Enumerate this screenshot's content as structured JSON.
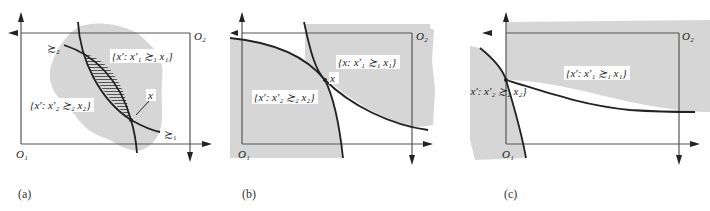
{
  "figure": {
    "panels": [
      {
        "id": "a",
        "caption": "(a)",
        "origin_bottom_left": "O₁",
        "origin_top_right": "O₂",
        "set_label_1": "{x′: x′₁ ≿₁ x₁}",
        "set_label_2": "{x′: x′₂ ≿₂ x₂}",
        "curve_label_1": "≿₁",
        "curve_label_2": "≿₂",
        "point_label": "x"
      },
      {
        "id": "b",
        "caption": "(b)",
        "origin_bottom_left": "O₁",
        "origin_top_right": "O₂",
        "set_label_1": "{x: x′₁ ≿₁ x₁}",
        "set_label_2": "{x′: x′₂ ≿₂ x₂}",
        "point_label": "x"
      },
      {
        "id": "c",
        "caption": "(c)",
        "origin_bottom_left": "O₁",
        "origin_top_right": "O₂",
        "set_label_1": "{x′: x′₁ ≿₁ x₁}",
        "set_label_2": "{x′: x′₂ ≿₂ x₂}",
        "curve_label_2": "≿₂"
      }
    ],
    "colors": {
      "shade": "#d6d6d6",
      "line": "#222222",
      "box": "#555555"
    }
  }
}
